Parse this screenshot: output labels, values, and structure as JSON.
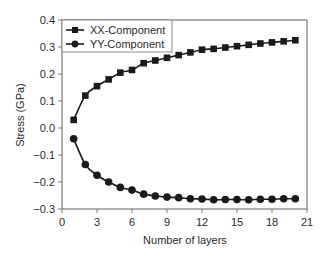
{
  "chart_data": {
    "type": "line",
    "title": "",
    "xlabel": "Number of layers",
    "ylabel": "Stress (GPa)",
    "xlim": [
      0,
      21
    ],
    "ylim": [
      -0.3,
      0.4
    ],
    "xticks": [
      0,
      3,
      6,
      9,
      12,
      15,
      18,
      21
    ],
    "xtick_labels": [
      "0",
      "3",
      "6",
      "9",
      "12",
      "15",
      "18",
      "21"
    ],
    "yticks": [
      0.4,
      0.3,
      0.2,
      0.1,
      0.0,
      -0.1,
      -0.2,
      -0.3
    ],
    "ytick_labels": [
      "0.4",
      "0.3",
      "0.2",
      "0.1",
      "0.0",
      "−0.1",
      "−0.2",
      "−0.3"
    ],
    "grid": false,
    "legend_position": "upper left",
    "x": [
      1,
      2,
      3,
      4,
      5,
      6,
      7,
      8,
      9,
      10,
      11,
      12,
      13,
      14,
      15,
      16,
      17,
      18,
      19,
      20
    ],
    "series": [
      {
        "name": "XX-Component",
        "marker": "square",
        "color": "#1a1a1a",
        "values": [
          0.03,
          0.12,
          0.155,
          0.18,
          0.205,
          0.215,
          0.24,
          0.25,
          0.26,
          0.27,
          0.28,
          0.29,
          0.293,
          0.298,
          0.303,
          0.308,
          0.313,
          0.317,
          0.321,
          0.325
        ]
      },
      {
        "name": "YY-Component",
        "marker": "circle",
        "color": "#1a1a1a",
        "values": [
          -0.04,
          -0.135,
          -0.175,
          -0.2,
          -0.22,
          -0.23,
          -0.245,
          -0.252,
          -0.256,
          -0.258,
          -0.262,
          -0.263,
          -0.266,
          -0.265,
          -0.265,
          -0.266,
          -0.264,
          -0.264,
          -0.262,
          -0.262
        ]
      }
    ]
  },
  "legend": {
    "items": [
      {
        "label": "XX-Component",
        "icon": "square-marker-icon"
      },
      {
        "label": "YY-Component",
        "icon": "circle-marker-icon"
      }
    ]
  },
  "axes": {
    "xlabel": "Number of layers",
    "ylabel": "Stress (GPa)",
    "axis_color": "#7a7a7a"
  }
}
